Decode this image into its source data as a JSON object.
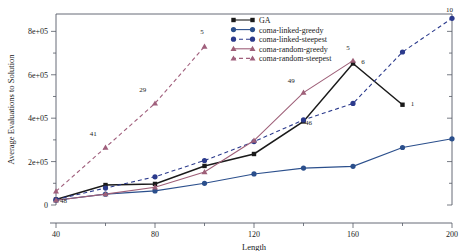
{
  "chart_data": {
    "type": "line",
    "title": "",
    "xlabel": "Length",
    "ylabel": "Average Evaluations to Solution",
    "xlim": [
      40,
      200
    ],
    "ylim": [
      0,
      880000
    ],
    "xticks": [
      40,
      80,
      120,
      160,
      200
    ],
    "xtick_labels": [
      "40",
      "80",
      "120",
      "160",
      "200"
    ],
    "yticks": [
      0,
      200000,
      400000,
      600000,
      800000
    ],
    "ytick_labels": [
      "0",
      "2e+05",
      "4e+05",
      "6e+05",
      "8e+05"
    ],
    "grid": false,
    "legend_position": "top-center",
    "series": [
      {
        "name": "GA",
        "color": "#1a1a1a",
        "marker": "square",
        "linestyle": "solid",
        "x": [
          40,
          60,
          80,
          100,
          120,
          140,
          160,
          180
        ],
        "values": [
          25000,
          92000,
          97000,
          180000,
          235000,
          385000,
          652000,
          462000
        ]
      },
      {
        "name": "coma-linked-greedy",
        "color": "#2b4f8c",
        "marker": "circle",
        "linestyle": "solid",
        "x": [
          40,
          60,
          80,
          100,
          120,
          140,
          160,
          180,
          200
        ],
        "values": [
          22000,
          50000,
          65000,
          100000,
          143000,
          170000,
          178000,
          265000,
          305000
        ]
      },
      {
        "name": "coma-linked-steepest",
        "color": "#2b3a8c",
        "marker": "circle",
        "linestyle": "dashed",
        "x": [
          40,
          60,
          80,
          100,
          120,
          140,
          160,
          180,
          200
        ],
        "values": [
          25000,
          78000,
          130000,
          205000,
          292000,
          392000,
          468000,
          705000,
          860000
        ]
      },
      {
        "name": "coma-random-greedy",
        "color": "#9e5f78",
        "marker": "triangle",
        "linestyle": "solid",
        "x": [
          40,
          60,
          80,
          100,
          120,
          140,
          160
        ],
        "values": [
          22000,
          50000,
          82000,
          152000,
          297000,
          518000,
          665000
        ]
      },
      {
        "name": "coma-random-steepest",
        "color": "#a05f7c",
        "marker": "triangle",
        "linestyle": "dashed",
        "x": [
          40,
          60,
          80,
          100
        ],
        "values": [
          63000,
          265000,
          468000,
          730000
        ]
      }
    ],
    "annotations": [
      {
        "text": "48",
        "x": 43,
        "y": 8000
      },
      {
        "text": "41",
        "x": 55,
        "y": 318000
      },
      {
        "text": "29",
        "x": 75,
        "y": 520000
      },
      {
        "text": "5",
        "x": 99,
        "y": 790000
      },
      {
        "text": "49",
        "x": 135,
        "y": 560000
      },
      {
        "text": "46",
        "x": 142,
        "y": 368000
      },
      {
        "text": "5",
        "x": 158,
        "y": 712000
      },
      {
        "text": "6",
        "x": 164,
        "y": 648000
      },
      {
        "text": "1",
        "x": 184,
        "y": 455000
      },
      {
        "text": "10",
        "x": 199,
        "y": 888000
      }
    ]
  },
  "legend": {
    "items": [
      {
        "label": "GA"
      },
      {
        "label": "coma-linked-greedy"
      },
      {
        "label": "coma-linked-steepest"
      },
      {
        "label": "coma-random-greedy"
      },
      {
        "label": "coma-random-steepest"
      }
    ]
  }
}
